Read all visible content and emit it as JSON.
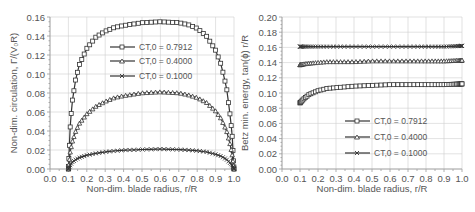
{
  "chart_data": [
    {
      "type": "line",
      "title": "",
      "xlabel": "Non-dim. blade radius, r/R",
      "ylabel": "Non-dim. circulation, Γ/(V0R)",
      "xlim": [
        0.0,
        1.0
      ],
      "ylim": [
        0.0,
        0.16
      ],
      "xticks": [
        "0.0",
        "0.1",
        "0.2",
        "0.3",
        "0.4",
        "0.5",
        "0.6",
        "0.7",
        "0.8",
        "0.9",
        "1.0"
      ],
      "yticks": [
        "0.00",
        "0.02",
        "0.04",
        "0.06",
        "0.08",
        "0.10",
        "0.12",
        "0.14",
        "0.16"
      ],
      "grid": true,
      "legend_position": "upper-center",
      "x": [
        0.1,
        0.11,
        0.12,
        0.14,
        0.16,
        0.2,
        0.25,
        0.3,
        0.35,
        0.4,
        0.5,
        0.6,
        0.7,
        0.75,
        0.8,
        0.85,
        0.9,
        0.93,
        0.96,
        0.98,
        0.99,
        1.0
      ],
      "series": [
        {
          "name": "CT,0 = 0.7912",
          "marker": "square",
          "values": [
            0.0,
            0.045,
            0.07,
            0.095,
            0.11,
            0.127,
            0.139,
            0.145,
            0.149,
            0.151,
            0.154,
            0.155,
            0.154,
            0.152,
            0.148,
            0.14,
            0.125,
            0.11,
            0.085,
            0.055,
            0.035,
            0.0
          ]
        },
        {
          "name": "CT,0 = 0.4000",
          "marker": "triangle",
          "values": [
            0.0,
            0.018,
            0.028,
            0.04,
            0.048,
            0.058,
            0.066,
            0.071,
            0.075,
            0.077,
            0.08,
            0.081,
            0.08,
            0.078,
            0.075,
            0.07,
            0.061,
            0.053,
            0.04,
            0.025,
            0.015,
            0.0
          ]
        },
        {
          "name": "CT,0 = 0.1000",
          "marker": "x",
          "values": [
            0.0,
            0.004,
            0.007,
            0.01,
            0.012,
            0.0145,
            0.0165,
            0.018,
            0.019,
            0.0198,
            0.0205,
            0.021,
            0.0205,
            0.02,
            0.0192,
            0.018,
            0.0155,
            0.0135,
            0.01,
            0.006,
            0.004,
            0.0
          ]
        }
      ]
    },
    {
      "type": "line",
      "title": "",
      "xlabel": "Non-dim. blade radius, r/R",
      "ylabel": "Betz min. energy, tan(ϕ) r/R",
      "xlim": [
        0.0,
        1.0
      ],
      "ylim": [
        0.0,
        0.2
      ],
      "xticks": [
        "0.0",
        "0.1",
        "0.2",
        "0.3",
        "0.4",
        "0.5",
        "0.6",
        "0.7",
        "0.8",
        "0.9",
        "1.0"
      ],
      "yticks": [
        "0.00",
        "0.02",
        "0.04",
        "0.06",
        "0.08",
        "0.10",
        "0.12",
        "0.14",
        "0.16",
        "0.18",
        "0.20"
      ],
      "grid": true,
      "legend_position": "lower-center",
      "x": [
        0.1,
        0.12,
        0.15,
        0.2,
        0.25,
        0.3,
        0.4,
        0.5,
        0.6,
        0.7,
        0.8,
        0.9,
        1.0
      ],
      "series": [
        {
          "name": "CT,0 = 0.7912",
          "marker": "square",
          "values": [
            0.087,
            0.092,
            0.098,
            0.103,
            0.106,
            0.107,
            0.109,
            0.11,
            0.111,
            0.111,
            0.111,
            0.111,
            0.112
          ]
        },
        {
          "name": "CT,0 = 0.4000",
          "marker": "triangle",
          "values": [
            0.137,
            0.138,
            0.139,
            0.14,
            0.141,
            0.141,
            0.141,
            0.142,
            0.142,
            0.142,
            0.142,
            0.142,
            0.143
          ]
        },
        {
          "name": "CT,0 = 0.1000",
          "marker": "x",
          "values": [
            0.161,
            0.161,
            0.161,
            0.161,
            0.161,
            0.161,
            0.161,
            0.161,
            0.161,
            0.161,
            0.161,
            0.161,
            0.162
          ]
        }
      ]
    }
  ],
  "left": {
    "ylabel": "Non-dim. circulation, Γ/(V₀R)",
    "xlabel": "Non-dim. blade radius, r/R",
    "legend": [
      "CT,0 = 0.7912",
      "CT,0 = 0.4000",
      "CT,0 = 0.1000"
    ]
  },
  "right": {
    "ylabel": "Betz min. energy, tan(ϕ) r/R",
    "xlabel": "Non-dim. blade radius, r/R",
    "legend": [
      "CT,0 = 0.7912",
      "CT,0 = 0.4000",
      "CT,0 = 0.1000"
    ]
  }
}
